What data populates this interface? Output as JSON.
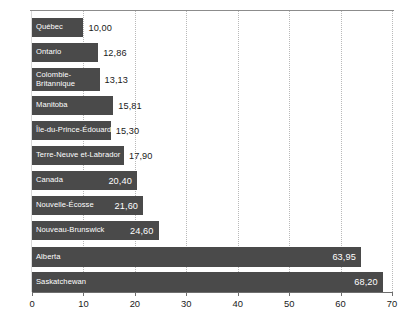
{
  "chart_data": {
    "type": "bar",
    "orientation": "horizontal",
    "title": "",
    "subtitle": "",
    "xlabel": "",
    "ylabel": "",
    "xlim": [
      0,
      70
    ],
    "xticks": [
      0,
      10,
      20,
      30,
      40,
      50,
      60,
      70
    ],
    "xtick_labels": [
      "0",
      "10",
      "20",
      "30",
      "40",
      "50",
      "60",
      "70"
    ],
    "grid": true,
    "grid_axis": "x",
    "grid_style": "dotted",
    "legend": false,
    "decimal_separator": ",",
    "bar_color": "#4a4a4a",
    "categories": [
      "Québec",
      "Ontario",
      "Colombie-\nBritannique",
      "Manitoba",
      "Île-du-Prince-Édouard",
      "Terre-Neuve et-Labrador",
      "Canada",
      "Nouvelle-Écosse",
      "Nouveau-Brunswick",
      "Alberta",
      "Saskatchewan"
    ],
    "values": [
      10.0,
      12.86,
      13.13,
      15.81,
      15.3,
      17.9,
      20.4,
      21.6,
      24.6,
      63.95,
      68.2
    ],
    "value_labels": [
      "10,00",
      "12,86",
      "13,13",
      "15,81",
      "15,30",
      "17,90",
      "20,40",
      "21,60",
      "24,60",
      "63,95",
      "68,20"
    ],
    "label_position": "inside-bar",
    "value_label_position": [
      "outside",
      "outside",
      "outside",
      "outside",
      "outside",
      "outside",
      "inside",
      "inside",
      "inside",
      "inside",
      "inside"
    ]
  },
  "bars": [
    {
      "label": "Québec",
      "value_label": "10,00",
      "value": 10.0
    },
    {
      "label": "Ontario",
      "value_label": "12,86",
      "value": 12.86
    },
    {
      "label": "Colombie-\nBritannique",
      "value_label": "13,13",
      "value": 13.13
    },
    {
      "label": "Manitoba",
      "value_label": "15,81",
      "value": 15.81
    },
    {
      "label": "Île-du-Prince-Édouard",
      "value_label": "15,30",
      "value": 15.3
    },
    {
      "label": "Terre-Neuve et-Labrador",
      "value_label": "17,90",
      "value": 17.9
    },
    {
      "label": "Canada",
      "value_label": "20,40",
      "value": 20.4
    },
    {
      "label": "Nouvelle-Écosse",
      "value_label": "21,60",
      "value": 21.6
    },
    {
      "label": "Nouveau-Brunswick",
      "value_label": "24,60",
      "value": 24.6
    },
    {
      "label": "Alberta",
      "value_label": "63,95",
      "value": 63.95
    },
    {
      "label": "Saskatchewan",
      "value_label": "68,20",
      "value": 68.2
    }
  ],
  "axis": {
    "ticks": [
      "0",
      "10",
      "20",
      "30",
      "40",
      "50",
      "60",
      "70"
    ]
  }
}
